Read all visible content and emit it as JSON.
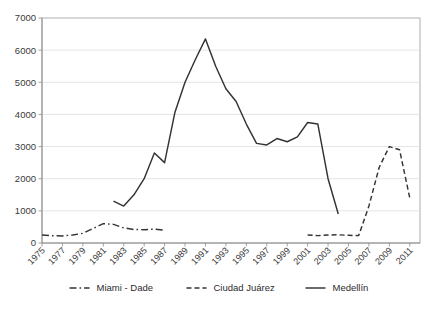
{
  "chart_data": {
    "type": "line",
    "title": "",
    "subtitle": "",
    "xlabel": "",
    "ylabel": "",
    "xlim": [
      1975,
      2012
    ],
    "ylim": [
      0,
      7000
    ],
    "ytick_values": [
      0,
      1000,
      2000,
      3000,
      4000,
      5000,
      6000,
      7000
    ],
    "ytick_labels": [
      "0",
      "1000",
      "2000",
      "3000",
      "4000",
      "5000",
      "6000",
      "7000"
    ],
    "xtick_values": [
      1975,
      1977,
      1979,
      1981,
      1983,
      1985,
      1987,
      1989,
      1991,
      1993,
      1995,
      1997,
      1999,
      2001,
      2003,
      2005,
      2007,
      2009,
      2011
    ],
    "xtick_labels": [
      "1975",
      "1977",
      "1979",
      "1981",
      "1983",
      "1985",
      "1987",
      "1989",
      "1991",
      "1993",
      "1995",
      "1997",
      "1999",
      "2001",
      "2003",
      "2005",
      "2007",
      "2009",
      "2011"
    ],
    "xtick_rotation": 45,
    "grid": true,
    "grid_axis": "y",
    "legend_position": "bottom",
    "series": [
      {
        "name": "Miami - Dade",
        "style": "dash-dot",
        "color": "#333333",
        "x": [
          1975,
          1976,
          1977,
          1978,
          1979,
          1980,
          1981,
          1982,
          1983,
          1984,
          1985,
          1986,
          1987
        ],
        "values": [
          250,
          225,
          220,
          250,
          300,
          450,
          600,
          580,
          470,
          420,
          415,
          430,
          400
        ]
      },
      {
        "name": "Ciudad Juárez",
        "style": "dashed",
        "color": "#333333",
        "x": [
          2001,
          2002,
          2003,
          2004,
          2005,
          2006,
          2007,
          2008,
          2009,
          2010,
          2011
        ],
        "values": [
          250,
          230,
          250,
          255,
          240,
          230,
          1150,
          2350,
          3000,
          2900,
          1400
        ]
      },
      {
        "name": "Medellín",
        "style": "solid",
        "color": "#333333",
        "x": [
          1982,
          1983,
          1984,
          1985,
          1986,
          1987,
          1988,
          1989,
          1990,
          1991,
          1992,
          1993,
          1994,
          1995,
          1996,
          1997,
          1998,
          1999,
          2000,
          2001,
          2002,
          2003,
          2004
        ],
        "values": [
          1300,
          1150,
          1500,
          2000,
          2800,
          2500,
          4050,
          5000,
          5700,
          6350,
          5500,
          4800,
          4400,
          3700,
          3100,
          3050,
          3250,
          3150,
          3300,
          3750,
          3700,
          2000,
          900
        ]
      }
    ]
  },
  "legend": {
    "items": [
      {
        "label": "Miami - Dade",
        "style": "dash-dot"
      },
      {
        "label": "Ciudad Juárez",
        "style": "dashed"
      },
      {
        "label": "Medellín",
        "style": "solid"
      }
    ]
  }
}
